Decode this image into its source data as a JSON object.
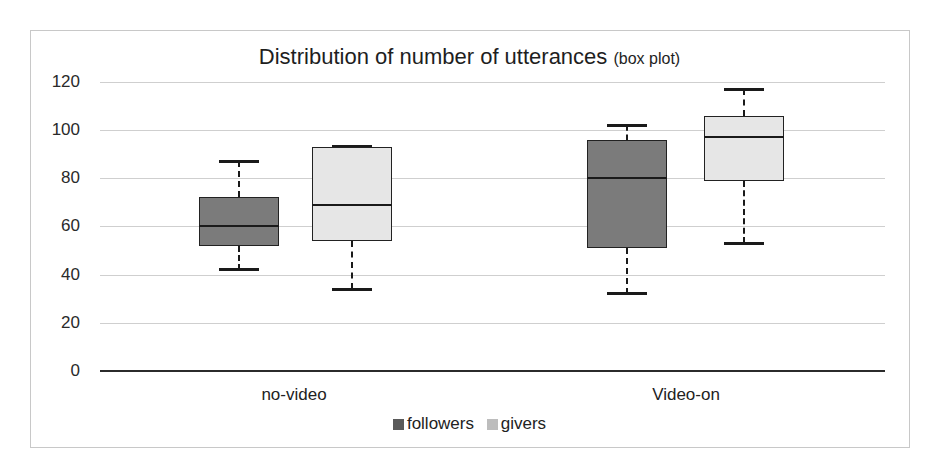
{
  "chart_data": {
    "type": "box",
    "title": "Distribution of number of utterances",
    "subtitle": "(box plot)",
    "xlabel": "",
    "ylabel": "",
    "ylim": [
      0,
      120
    ],
    "yticks": [
      0,
      20,
      40,
      60,
      80,
      100,
      120
    ],
    "grid": true,
    "legend_position": "bottom",
    "categories": [
      "no-video",
      "Video-on"
    ],
    "series": [
      {
        "name": "followers",
        "color": "#7b7b7b",
        "boxes": [
          {
            "category": "no-video",
            "whisker_low": 42,
            "q1": 52,
            "median": 60,
            "q3": 72,
            "whisker_high": 87
          },
          {
            "category": "Video-on",
            "whisker_low": 32,
            "q1": 51,
            "median": 80,
            "q3": 96,
            "whisker_high": 102
          }
        ]
      },
      {
        "name": "givers",
        "color": "#e6e6e6",
        "boxes": [
          {
            "category": "no-video",
            "whisker_low": 34,
            "q1": 54,
            "median": 69,
            "q3": 93,
            "whisker_high": 93
          },
          {
            "category": "Video-on",
            "whisker_low": 53,
            "q1": 79,
            "median": 97,
            "q3": 106,
            "whisker_high": 117
          }
        ]
      }
    ]
  },
  "labels": {
    "title_main": "Distribution of number of utterances ",
    "title_sub": "(box plot)",
    "yticks": [
      "0",
      "20",
      "40",
      "60",
      "80",
      "100",
      "120"
    ],
    "categories": [
      "no-video",
      "Video-on"
    ],
    "legend": [
      "followers",
      "givers"
    ]
  }
}
